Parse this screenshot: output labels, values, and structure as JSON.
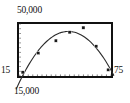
{
  "figure": {
    "background_color": "#ffffff",
    "frame_color": "#111111",
    "curve_color": "#2b2b2b",
    "marker_color": "#1a1a1a",
    "labels": {
      "y_max": "50,000",
      "y_min": "15",
      "x_max": "75",
      "x_min": "15,000"
    }
  },
  "chart_data": {
    "type": "scatter",
    "title": "",
    "subtitle": "",
    "xlabel": "",
    "ylabel": "",
    "xlim": [
      15000,
      75000
    ],
    "ylim": [
      15,
      50000
    ],
    "x_tick_labels": [
      "15,000",
      "75"
    ],
    "y_tick_labels": [
      "15",
      "50,000"
    ],
    "grid": false,
    "legend": null,
    "legend_position": "none",
    "axis_ticks": {
      "bottom": "dotted",
      "left": "dotted",
      "bottom_tick_count": 20,
      "left_tick_count": 11
    },
    "series": [
      {
        "name": "observations",
        "marker": "square",
        "x": [
          0.04,
          0.21,
          0.4,
          0.55,
          0.7,
          0.84,
          0.97
        ],
        "y": [
          0.07,
          0.44,
          0.68,
          0.84,
          0.93,
          0.57,
          0.12
        ],
        "note": "x and y given as normalized fractions of the plot frame (0 = left/bottom, 1 = right/top)"
      },
      {
        "name": "fitted-quadratic",
        "marker": "none",
        "type": "line",
        "note": "downward-opening parabola fitted through the observations, peaking near the middle-right of the frame"
      }
    ]
  }
}
